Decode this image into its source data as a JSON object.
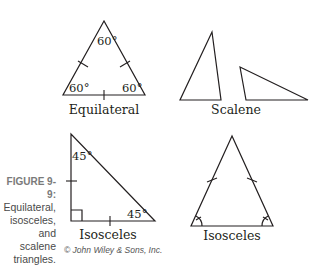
{
  "figure": {
    "number": "FIGURE 9-9:",
    "caption_lines": [
      "Equilateral,",
      "isosceles,",
      "and scalene",
      "triangles."
    ],
    "credit": "© John Wiley & Sons, Inc."
  },
  "triangles": [
    {
      "name": "equilateral",
      "label": "Equilateral",
      "angles": [
        "60°",
        "60°",
        "60°"
      ]
    },
    {
      "name": "scalene",
      "label": "Scalene"
    },
    {
      "name": "isosceles-right",
      "label": "Isosceles",
      "angles": [
        "45°",
        "45°"
      ]
    },
    {
      "name": "isosceles-acute",
      "label": "Isosceles"
    }
  ],
  "colors": {
    "line": "#231f20",
    "caption_number": "#7a7a7a",
    "caption_text": "#4a4a4a"
  }
}
